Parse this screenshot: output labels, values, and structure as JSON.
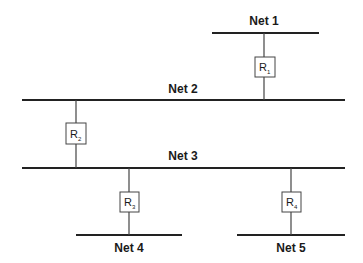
{
  "diagram": {
    "nets": [
      {
        "id": "net1",
        "label": "Net 1"
      },
      {
        "id": "net2",
        "label": "Net 2"
      },
      {
        "id": "net3",
        "label": "Net 3"
      },
      {
        "id": "net4",
        "label": "Net 4"
      },
      {
        "id": "net5",
        "label": "Net 5"
      }
    ],
    "routers": [
      {
        "id": "r1",
        "letter": "R",
        "sub": "1",
        "connects": [
          "Net 1",
          "Net 2"
        ]
      },
      {
        "id": "r2",
        "letter": "R",
        "sub": "2",
        "connects": [
          "Net 2",
          "Net 3"
        ]
      },
      {
        "id": "r3",
        "letter": "R",
        "sub": "3",
        "connects": [
          "Net 3",
          "Net 4"
        ]
      },
      {
        "id": "r4",
        "letter": "R",
        "sub": "4",
        "connects": [
          "Net 3",
          "Net 5"
        ]
      }
    ]
  }
}
